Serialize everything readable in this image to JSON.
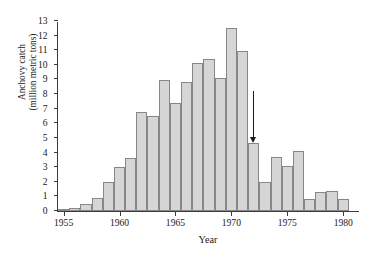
{
  "chart_data": {
    "type": "bar",
    "title": "",
    "xlabel": "Year",
    "ylabel": "Anchovy catch\n(million metric tons)",
    "ylabel_line1": "Anchovy catch",
    "ylabel_line2": "(million metric tons)",
    "xlim": [
      1954.5,
      1981.5
    ],
    "ylim": [
      0,
      13
    ],
    "ytick_step": 1,
    "grid": false,
    "legend": null,
    "categories": [
      1955,
      1956,
      1957,
      1958,
      1959,
      1960,
      1961,
      1962,
      1963,
      1964,
      1965,
      1966,
      1967,
      1968,
      1969,
      1970,
      1971,
      1972,
      1973,
      1974,
      1975,
      1976,
      1977,
      1978,
      1979,
      1980,
      1981
    ],
    "values": [
      0.1,
      0.2,
      0.5,
      0.9,
      2.0,
      3.0,
      3.65,
      6.8,
      6.5,
      8.95,
      7.4,
      8.8,
      10.1,
      10.4,
      9.1,
      12.5,
      10.95,
      4.65,
      2.0,
      3.7,
      3.05,
      4.1,
      0.8,
      1.3,
      1.35,
      0.85,
      0.0
    ],
    "xticks": [
      1955,
      1960,
      1965,
      1970,
      1975,
      1980
    ],
    "xtick_labels": [
      "1955",
      "1960",
      "1965",
      "1970",
      "1975",
      "1980"
    ],
    "yticks": [
      0,
      1,
      2,
      3,
      4,
      5,
      6,
      7,
      8,
      9,
      10,
      11,
      12,
      13
    ],
    "ytick_labels": [
      "0",
      "1",
      "2",
      "3",
      "4",
      "5",
      "6",
      "7",
      "8",
      "9",
      "10",
      "11",
      "12",
      "13"
    ],
    "annotations": [
      {
        "name": "collapse-arrow",
        "type": "arrow",
        "direction": "down",
        "x": 1972,
        "y_tip": 4.65,
        "y_tail": 8.2,
        "label": ""
      }
    ],
    "colors": {
      "bar_fill": "#d6d6d6",
      "bar_edge": "#878787",
      "axis": "#3c3c3c",
      "text": "#1a1a1a",
      "arrow": "#1a1a1a",
      "background": "#ffffff"
    }
  }
}
